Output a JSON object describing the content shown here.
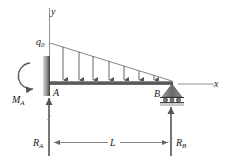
{
  "diagram": {
    "type": "beam-free-body-diagram",
    "labels": {
      "y_axis": "y",
      "x_axis": "x",
      "load_intensity": "q",
      "load_intensity_sub": "0",
      "point_a": "A",
      "point_b": "B",
      "moment": "M",
      "moment_sub": "A",
      "reaction_a": "R",
      "reaction_a_sub": "A",
      "reaction_b": "R",
      "reaction_b_sub": "B",
      "length": "L"
    },
    "load": {
      "shape": "triangular",
      "max_at": "A",
      "zero_at": "B",
      "arrow_count": 7
    },
    "supports": [
      {
        "point": "A",
        "type": "fixed-wall"
      },
      {
        "point": "B",
        "type": "roller",
        "roller_count": 3
      }
    ],
    "colors": {
      "beam": "#5a5a5a",
      "wall": "#8a8a8a",
      "arrows": "#555555",
      "lines": "#666666",
      "support": "#6f6f6f"
    }
  }
}
